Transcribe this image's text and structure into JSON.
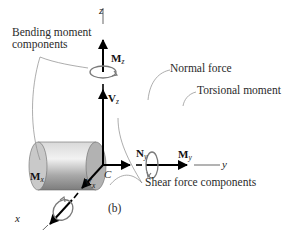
{
  "diagram": {
    "caption": "(b)",
    "labels": {
      "bending_moment": [
        "Bending moment",
        "components"
      ],
      "normal_force": "Normal force",
      "torsional_moment": "Torsional moment",
      "shear_force": "Shear force components"
    },
    "axes": {
      "x": "x",
      "y": "y",
      "z": "z"
    },
    "centroid": "C",
    "vectors": {
      "Mz": {
        "main": "M",
        "sub": "z"
      },
      "Vz": {
        "main": "V",
        "sub": "z"
      },
      "Ny": {
        "main": "N",
        "sub": "y"
      },
      "My": {
        "main": "M",
        "sub": "y"
      },
      "Vx": {
        "main": "V",
        "sub": "x"
      },
      "Mx": {
        "main": "M",
        "sub": "x"
      }
    },
    "colors": {
      "cylinder_light": "#e6e6e6",
      "cylinder_dark": "#8a8a8a",
      "cylinder_face": "#b5b5b5",
      "arrow": "#000000",
      "moment_loop": "#7a7a7a",
      "leader": "#888888"
    }
  }
}
